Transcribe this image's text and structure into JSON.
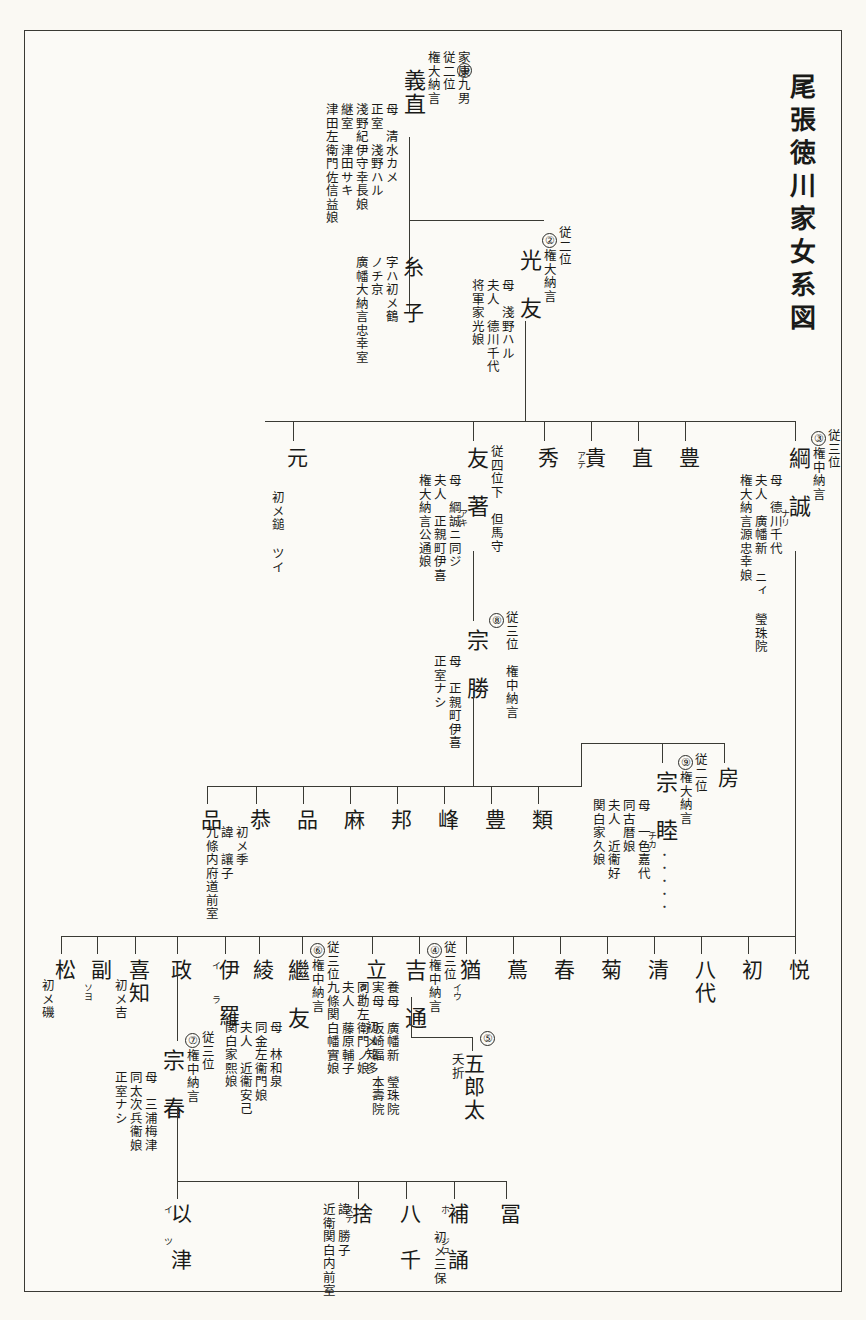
{
  "document": {
    "title": "尾張徳川家女系図",
    "kind": "japanese-genealogy-chart"
  },
  "generation1": {
    "head": {
      "number": "①",
      "name": "義直",
      "rank": "家康九男\n従二位\n権大納言",
      "rank_lines": [
        "家康九男",
        "従二位",
        "権大納言"
      ],
      "detail_lines": [
        "母　清水カメ",
        "正室　淺野ハル",
        "淺野紀伊守幸長娘",
        "継室　津田サキ",
        "津田左衛門佐信益娘"
      ]
    },
    "daughter": {
      "name": "糸　子",
      "detail_lines": [
        "字ハ初メ鶴",
        "ノチ京",
        "廣幡大納言忠幸室"
      ]
    }
  },
  "generation2": {
    "head": {
      "number": "②",
      "name": "光　友",
      "rank_lines": [
        "従二位",
        "権大納言"
      ],
      "detail_lines": [
        "母　淺野ハル",
        "夫人　德川千代",
        "将軍家光娘"
      ]
    }
  },
  "generation3": {
    "head": {
      "number": "③",
      "name": "綱　誠",
      "kana": "ナリ",
      "rank_lines": [
        "従三位",
        "権中納言"
      ],
      "detail_lines": [
        "母　德川千代",
        "夫人　廣幡新 ニィ 瑩珠院",
        "権大納言源忠幸娘"
      ]
    },
    "siblings": [
      {
        "name": "豊"
      },
      {
        "name": "直"
      },
      {
        "name": "貴",
        "kana": "アテ"
      },
      {
        "name": "秀"
      },
      {
        "name": "友　著",
        "kana": "アキ",
        "rank_lines": [
          "従四位下　但馬守"
        ],
        "detail_lines": [
          "母　綱誠ニ同ジ",
          "夫人　正親町伊喜",
          "権大納言公通娘"
        ]
      },
      {
        "name": "元",
        "detail_lines": [
          "初メ鎚 ツイ"
        ]
      }
    ]
  },
  "generation4": {
    "munekatsu": {
      "number": "⑧",
      "name": "宗　勝",
      "rank_lines": [
        "従三位　権中納言"
      ],
      "detail_lines": [
        "母　正親町伊喜",
        "正室ナシ"
      ]
    },
    "children_row": [
      {
        "name": "房"
      },
      {
        "number": "⑨",
        "name": "宗　睦",
        "kana": "チカ",
        "rank_lines": [
          "従二位",
          "権大納言"
        ],
        "detail_lines": [
          "母　一色嘉代",
          "同古暦娘",
          "夫人　近衞好",
          "関白家久娘"
        ],
        "trailing": "・・・・・"
      },
      {
        "name": "類"
      },
      {
        "name": "豊"
      },
      {
        "name": "峰"
      },
      {
        "name": "邦"
      },
      {
        "name": "麻"
      },
      {
        "name": "品"
      },
      {
        "name": "恭",
        "detail_lines": [
          "初メ季",
          "諱　讓子",
          "九條内府道前室"
        ]
      },
      {
        "name": "品"
      }
    ]
  },
  "generation5": {
    "row": [
      {
        "name": "悦"
      },
      {
        "name": "初"
      },
      {
        "name": "八代",
        "stacked": true
      },
      {
        "name": "清"
      },
      {
        "name": "菊"
      },
      {
        "name": "春"
      },
      {
        "name": "蔦"
      },
      {
        "name": "猶",
        "kana": "イウ"
      },
      {
        "number": "④",
        "name": "吉　通",
        "rank_lines": [
          "従三位",
          "権中納言"
        ],
        "detail_lines": [
          "養母　廣幡新　瑩珠院",
          "実母　坂崎福　本壽院",
          "同勘左衛門ノ娘",
          "夫人　藤原輔子",
          "九條関白幡實娘"
        ]
      },
      {
        "number": "⑥",
        "name": "繼　友",
        "rank_lines": [
          "従三位",
          "権中納言"
        ],
        "detail_lines": [
          "母　林和泉",
          "同金左衞門娘",
          "夫人　近衞安己",
          "関白家熙娘"
        ]
      },
      {
        "name": "立",
        "kana": "タツ",
        "detail_lines": [
          "初メ知多"
        ]
      },
      {
        "name": "綾"
      },
      {
        "name": "伊　羅",
        "kana_top": "イ",
        "kana_bottom": "ラ"
      },
      {
        "name": "政"
      },
      {
        "name": "喜知",
        "detail_lines": [
          "初メ吉"
        ]
      },
      {
        "name": "副",
        "kana": "ソヨ"
      },
      {
        "name": "松",
        "detail_lines": [
          "初メ磯"
        ]
      }
    ],
    "goroota": {
      "number": "⑤",
      "name": "五郎太",
      "detail_lines": [
        "夭折"
      ]
    },
    "muneharu": {
      "number": "⑦",
      "name": "宗　春",
      "rank_lines": [
        "従三位",
        "権中納言"
      ],
      "detail_lines": [
        "母　三浦梅津",
        "同太次兵衞娘",
        "正室ナシ"
      ]
    }
  },
  "generation6": {
    "row": [
      {
        "name": "冨"
      },
      {
        "name": "補　誦",
        "kana_top": "ホ",
        "kana_bottom": "ジュ",
        "detail_lines": [
          "初メ三保"
        ]
      },
      {
        "name": "八　千"
      },
      {
        "name": "捨",
        "kana": "ステ",
        "detail_lines": [
          "諱　勝子",
          "近衛関白内前室"
        ]
      },
      {
        "name": "以　津",
        "kana_top": "イ",
        "kana_bottom": "ツ"
      }
    ]
  }
}
